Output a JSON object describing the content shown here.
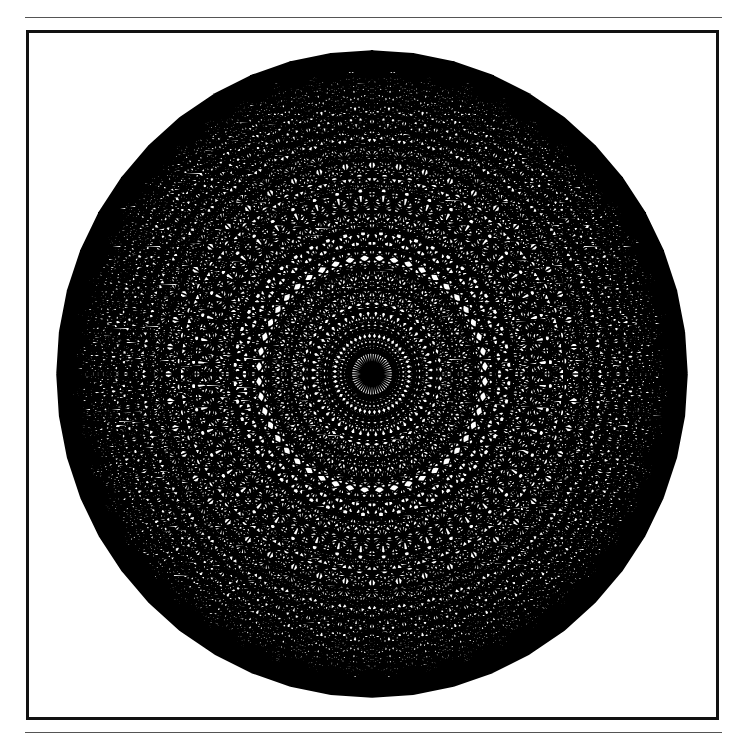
{
  "figure": {
    "type": "complete-graph-chord-diagram",
    "vertex_count": 48,
    "center": [
      372,
      374
    ],
    "radius_x": 315,
    "radius_y": 323,
    "start_angle_deg": -90,
    "line_color": "#000000",
    "background_color": "#ffffff",
    "frame_color": "#111111"
  }
}
